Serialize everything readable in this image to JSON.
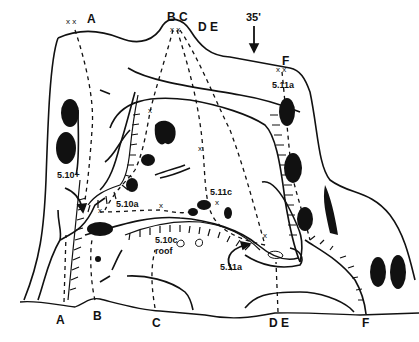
{
  "diagram": {
    "type": "climbing-topo",
    "height_marker": "35'",
    "top_labels": {
      "a": "A",
      "bc": "B C",
      "de": "D E",
      "f": "F"
    },
    "bottom_labels": {
      "a": "A",
      "b": "B",
      "c": "C",
      "de": "D E",
      "f": "F"
    },
    "anchor_mark": "x x",
    "grades": [
      {
        "route": "A",
        "grade": "5.10+"
      },
      {
        "route": "B",
        "grade": "5.10a"
      },
      {
        "route": "C",
        "grade": "5.10c",
        "note": "roof"
      },
      {
        "route": "D",
        "grade": "5.11c"
      },
      {
        "route": "E",
        "grade": "5.11a"
      },
      {
        "route": "F",
        "grade": "5.11a"
      }
    ],
    "colors": {
      "ink": "#111111",
      "background": "#ffffff"
    }
  }
}
